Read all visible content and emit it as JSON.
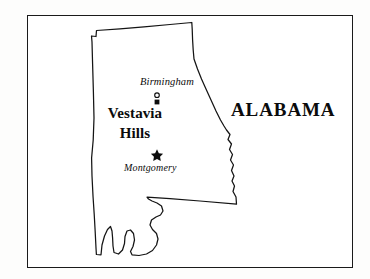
{
  "figure": {
    "kind": "locator-map",
    "subject": "Alabama",
    "frame": {
      "visible": true,
      "color": "#1a1a1a"
    },
    "background_color": "#ffffff",
    "ink_color": "#0d0d0d"
  },
  "state": {
    "name": "ALABAMA",
    "outline_color": "#141414",
    "fill_color": "#ffffff"
  },
  "labels": {
    "state": "ALABAMA",
    "birmingham": "Birmingham",
    "vestavia_line1": "Vestavia",
    "vestavia_line2": "Hills",
    "montgomery": "Montgomery"
  },
  "places": [
    {
      "name": "Birmingham",
      "label": "Birmingham",
      "marker": "open-circle",
      "style": "italic",
      "x": 157,
      "y": 95
    },
    {
      "name": "Vestavia Hills",
      "label": "Vestavia Hills",
      "marker": "filled-square",
      "style": "bold",
      "x": 157,
      "y": 102
    },
    {
      "name": "Montgomery",
      "label": "Montgomery",
      "marker": "star",
      "style": "italic",
      "x": 157,
      "y": 154
    }
  ],
  "markers": {
    "birmingham_symbol": "circle-marker",
    "vestavia_symbol": "square-marker",
    "montgomery_symbol": "star-marker"
  }
}
